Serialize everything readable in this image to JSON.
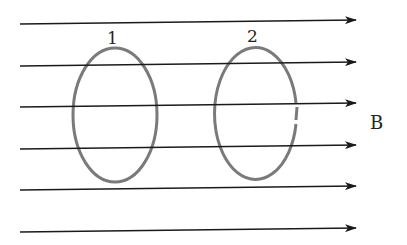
{
  "diagram": {
    "field_label": "B",
    "field_lines": [
      {
        "y1": 24,
        "y2": 20
      },
      {
        "y1": 66,
        "y2": 62
      },
      {
        "y1": 107,
        "y2": 103
      },
      {
        "y1": 149,
        "y2": 145
      },
      {
        "y1": 190,
        "y2": 186
      },
      {
        "y1": 232,
        "y2": 228
      }
    ],
    "field_line_x_start": 20,
    "field_line_x_end": 356,
    "loops": [
      {
        "label": "1",
        "cx": 115,
        "cy": 115,
        "rx": 42,
        "ry": 67,
        "closed": true
      },
      {
        "label": "2",
        "cx": 256,
        "cy": 114,
        "rx": 41,
        "ry": 66,
        "closed": false
      }
    ],
    "colors": {
      "field_line": "#1a1a1a",
      "loop": "#7a7a7a"
    }
  }
}
